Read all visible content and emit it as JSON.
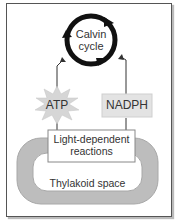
{
  "diagram": {
    "cycle": {
      "line1": "Calvin",
      "line2": "cycle"
    },
    "atp": {
      "label": "ATP"
    },
    "nadph": {
      "label": "NADPH"
    },
    "light_reactions": {
      "line1": "Light-dependent",
      "line2": "reactions"
    },
    "thylakoid": {
      "label": "Thylakoid space"
    },
    "colors": {
      "ring": "#111111",
      "membrane": "#b8b8b8",
      "box_fill": "#e6e6e6",
      "starburst": "#d9d9d9",
      "text": "#333333"
    }
  }
}
